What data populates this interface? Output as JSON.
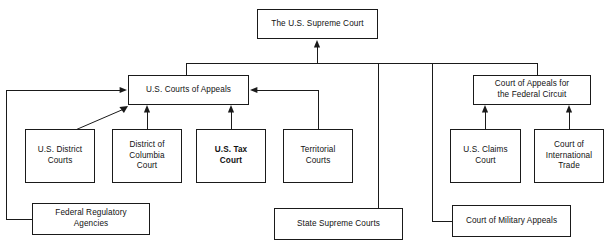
{
  "diagram": {
    "stroke_color": "#1a1a1a",
    "background_color": "#ffffff",
    "nodes": [
      {
        "id": "supreme-court",
        "label": "The U.S. Supreme Court",
        "x": 257,
        "y": 9,
        "w": 121,
        "h": 30,
        "bold": false
      },
      {
        "id": "courts-of-appeals",
        "label": "U.S. Courts of Appeals",
        "x": 128,
        "y": 75,
        "w": 121,
        "h": 30,
        "bold": false
      },
      {
        "id": "federal-circuit",
        "label": "Court of Appeals for\nthe Federal Circuit",
        "x": 473,
        "y": 75,
        "w": 118,
        "h": 30,
        "bold": false
      },
      {
        "id": "district-courts",
        "label": "U.S. District\nCourts",
        "x": 25,
        "y": 129,
        "w": 70,
        "h": 54,
        "bold": false
      },
      {
        "id": "dc-court",
        "label": "District of\nColumbia\nCourt",
        "x": 112,
        "y": 129,
        "w": 70,
        "h": 54,
        "bold": false
      },
      {
        "id": "tax-court",
        "label": "U.S. Tax\nCourt",
        "x": 196,
        "y": 129,
        "w": 70,
        "h": 54,
        "bold": true
      },
      {
        "id": "territorial-courts",
        "label": "Territorial\nCourts",
        "x": 283,
        "y": 129,
        "w": 70,
        "h": 54,
        "bold": false
      },
      {
        "id": "claims-court",
        "label": "U.S. Claims\nCourt",
        "x": 450,
        "y": 129,
        "w": 71,
        "h": 54,
        "bold": false
      },
      {
        "id": "international-trade",
        "label": "Court of\nInternational\nTrade",
        "x": 534,
        "y": 129,
        "w": 70,
        "h": 54,
        "bold": false
      },
      {
        "id": "federal-regulatory-agencies",
        "label": "Federal Regulatory\nAgencies",
        "x": 32,
        "y": 203,
        "w": 118,
        "h": 32,
        "bold": false
      },
      {
        "id": "state-supreme-courts",
        "label": "State Supreme Courts",
        "x": 274,
        "y": 208,
        "w": 129,
        "h": 32,
        "bold": false
      },
      {
        "id": "military-appeals",
        "label": "Court of Military Appeals",
        "x": 452,
        "y": 205,
        "w": 119,
        "h": 32,
        "bold": false
      }
    ],
    "edges": [
      {
        "id": "bus-to-supreme-court",
        "from": "appeals-bus",
        "to": "supreme-court",
        "path": "M 317 63 L 317 43",
        "arrow": "up"
      },
      {
        "id": "appeals-bus",
        "from": "lower-courts",
        "to": "bus",
        "path": "M 186 63 L 537 63",
        "arrow": "none"
      },
      {
        "id": "bus-drop-left",
        "from": "bus",
        "to": "courts-of-appeals",
        "path": "M 186 63 L 186 75",
        "arrow": "none"
      },
      {
        "id": "bus-drop-state-supreme",
        "from": "bus",
        "to": "state-supreme-courts",
        "path": "M 378 63 L 378 208",
        "arrow": "none"
      },
      {
        "id": "bus-drop-military",
        "from": "bus",
        "to": "military-appeals",
        "path": "M 432 63 L 432 221 L 452 221",
        "arrow": "none"
      },
      {
        "id": "bus-drop-federal-circuit",
        "from": "bus",
        "to": "federal-circuit",
        "path": "M 537 63 L 537 75",
        "arrow": "none"
      },
      {
        "id": "district-to-appeals",
        "from": "district-courts",
        "to": "courts-of-appeals",
        "path": "M 73 130 L 126 107",
        "arrow": "diagonal"
      },
      {
        "id": "dc-to-appeals",
        "from": "dc-court",
        "to": "courts-of-appeals",
        "path": "M 147 129 L 147 109",
        "arrow": "up"
      },
      {
        "id": "tax-to-appeals",
        "from": "tax-court",
        "to": "courts-of-appeals",
        "path": "M 231 129 L 231 109",
        "arrow": "up"
      },
      {
        "id": "territorial-to-appeals",
        "from": "territorial-courts",
        "to": "courts-of-appeals",
        "path": "M 318 129 L 318 90 L 253 90",
        "arrow": "left"
      },
      {
        "id": "regulatory-to-appeals",
        "from": "federal-regulatory-agencies",
        "to": "courts-of-appeals",
        "path": "M 32 219 L 6 219 L 6 90 L 124 90",
        "arrow": "right"
      },
      {
        "id": "claims-to-federal-circuit",
        "from": "claims-court",
        "to": "federal-circuit",
        "path": "M 485 129 L 485 109",
        "arrow": "up"
      },
      {
        "id": "trade-to-federal-circuit",
        "from": "international-trade",
        "to": "federal-circuit",
        "path": "M 569 129 L 569 109",
        "arrow": "up"
      }
    ]
  }
}
